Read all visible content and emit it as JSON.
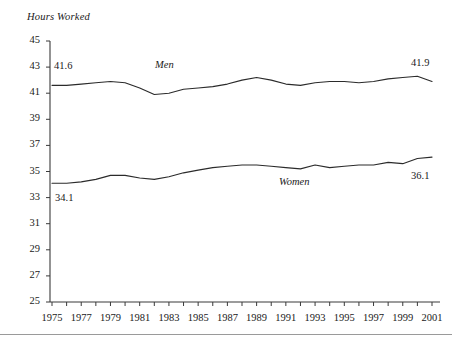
{
  "chart_data": {
    "type": "line",
    "title": "",
    "ylabel": "Hours Worked",
    "xlabel": "",
    "ylim": [
      25,
      45
    ],
    "xlim": [
      1975,
      2001
    ],
    "grid": false,
    "legend_position": "inline-annotation",
    "yticks": [
      25,
      27,
      29,
      31,
      33,
      35,
      37,
      39,
      41,
      43,
      45
    ],
    "ytick_labels": [
      "25",
      "27",
      "29",
      "31",
      "33",
      "35",
      "37",
      "39",
      "41",
      "43",
      "45"
    ],
    "xticks": [
      1975,
      1977,
      1979,
      1981,
      1983,
      1985,
      1987,
      1989,
      1991,
      1993,
      1995,
      1997,
      1999,
      2001
    ],
    "xtick_labels": [
      "1975",
      "1977",
      "1979",
      "1981",
      "1983",
      "1985",
      "1987",
      "1989",
      "1991",
      "1993",
      "1995",
      "1997",
      "1999",
      "2001"
    ],
    "x": [
      1975,
      1976,
      1977,
      1978,
      1979,
      1980,
      1981,
      1982,
      1983,
      1984,
      1985,
      1986,
      1987,
      1988,
      1989,
      1990,
      1991,
      1992,
      1993,
      1994,
      1995,
      1996,
      1997,
      1998,
      1999,
      2000,
      2001
    ],
    "series": [
      {
        "name": "Men",
        "label": "Men",
        "start_value": 41.6,
        "end_value": 41.9,
        "start_label": "41.6",
        "end_label": "41.9",
        "values": [
          41.6,
          41.6,
          41.7,
          41.8,
          41.9,
          41.8,
          41.4,
          40.9,
          41.0,
          41.3,
          41.4,
          41.5,
          41.7,
          42.0,
          42.2,
          42.0,
          41.7,
          41.6,
          41.8,
          41.9,
          41.9,
          41.8,
          41.9,
          42.1,
          42.2,
          42.3,
          41.9
        ]
      },
      {
        "name": "Women",
        "label": "Women",
        "start_value": 34.1,
        "end_value": 36.1,
        "start_label": "34.1",
        "end_label": "36.1",
        "values": [
          34.1,
          34.1,
          34.2,
          34.4,
          34.7,
          34.7,
          34.5,
          34.4,
          34.6,
          34.9,
          35.1,
          35.3,
          35.4,
          35.5,
          35.5,
          35.4,
          35.3,
          35.2,
          35.5,
          35.3,
          35.4,
          35.5,
          35.5,
          35.7,
          35.6,
          36.0,
          36.1
        ]
      }
    ],
    "annotations": [
      {
        "text": "Men",
        "series": "Men"
      },
      {
        "text": "Women",
        "series": "Women"
      },
      {
        "text": "41.6",
        "series": "Men",
        "position": "start"
      },
      {
        "text": "41.9",
        "series": "Men",
        "position": "end"
      },
      {
        "text": "34.1",
        "series": "Women",
        "position": "start"
      },
      {
        "text": "36.1",
        "series": "Women",
        "position": "end"
      }
    ]
  }
}
